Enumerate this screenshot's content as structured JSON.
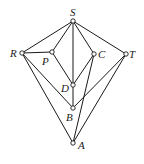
{
  "diagram": {
    "type": "graph",
    "colors": {
      "stroke": "#1a1a1a",
      "background": "#ffffff"
    },
    "nodes": [
      {
        "id": "S",
        "label": "S",
        "x": 73,
        "y": 21,
        "lx": 70,
        "ly": 16
      },
      {
        "id": "R",
        "label": "R",
        "x": 22,
        "y": 53,
        "lx": 10,
        "ly": 57
      },
      {
        "id": "P",
        "label": "P",
        "x": 52,
        "y": 52,
        "lx": 42,
        "ly": 65
      },
      {
        "id": "C",
        "label": "C",
        "x": 94,
        "y": 54,
        "lx": 98,
        "ly": 58
      },
      {
        "id": "T",
        "label": "T",
        "x": 126,
        "y": 54,
        "lx": 129,
        "ly": 58
      },
      {
        "id": "D",
        "label": "D",
        "x": 73,
        "y": 85,
        "lx": 61,
        "ly": 92
      },
      {
        "id": "B",
        "label": "B",
        "x": 73,
        "y": 108,
        "lx": 66,
        "ly": 121
      },
      {
        "id": "A",
        "label": "A",
        "x": 73,
        "y": 143,
        "lx": 78,
        "ly": 149
      }
    ],
    "edges": [
      [
        "S",
        "R"
      ],
      [
        "S",
        "P"
      ],
      [
        "S",
        "D"
      ],
      [
        "S",
        "C"
      ],
      [
        "S",
        "T"
      ],
      [
        "R",
        "P"
      ],
      [
        "R",
        "B"
      ],
      [
        "R",
        "A"
      ],
      [
        "P",
        "D"
      ],
      [
        "C",
        "D"
      ],
      [
        "C",
        "A"
      ],
      [
        "T",
        "B"
      ],
      [
        "T",
        "A"
      ],
      [
        "D",
        "B"
      ]
    ]
  }
}
